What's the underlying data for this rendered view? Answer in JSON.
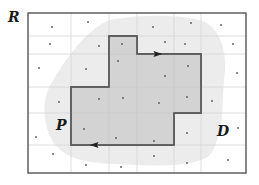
{
  "labels": {
    "region": "R",
    "polygon": "P",
    "domain": "D"
  },
  "colors": {
    "background": "#ffffff",
    "frame": "#555555",
    "grid": "#d6d6d6",
    "blob_fill": "#ececec",
    "polygon_fill": "#cfcfcf",
    "polygon_stroke": "#555555",
    "dot": "#555555",
    "arrow": "#222222"
  },
  "frame": {
    "x": 28,
    "y": 13,
    "width": 218,
    "height": 160
  },
  "grid": {
    "vertical_lines_x": [
      71,
      109,
      137,
      174,
      201
    ],
    "horizontal_lines_y": [
      36,
      54,
      87,
      113,
      145
    ]
  },
  "polygon_P": {
    "vertices": [
      [
        71,
        87
      ],
      [
        109,
        87
      ],
      [
        109,
        36
      ],
      [
        137,
        36
      ],
      [
        137,
        54
      ],
      [
        201,
        54
      ],
      [
        201,
        113
      ],
      [
        174,
        113
      ],
      [
        174,
        145
      ],
      [
        71,
        145
      ]
    ],
    "arrows": [
      {
        "x": 158,
        "y": 54,
        "direction": "right"
      },
      {
        "x": 94,
        "y": 145,
        "direction": "left"
      }
    ]
  },
  "blob_D_path": "M 110 20 C 140 14, 185 14, 205 22 C 222 32, 228 55, 224 80 C 222 105, 224 135, 210 155 C 195 168, 150 166, 115 164 C 85 163, 62 158, 52 140 C 42 120, 42 98, 52 82 C 66 58, 88 28, 110 20 Z",
  "sample_points": [
    [
      52,
      27
    ],
    [
      88,
      22
    ],
    [
      153,
      27
    ],
    [
      191,
      23
    ],
    [
      221,
      25
    ],
    [
      50,
      44
    ],
    [
      99,
      46
    ],
    [
      122,
      44
    ],
    [
      165,
      42
    ],
    [
      185,
      44
    ],
    [
      233,
      44
    ],
    [
      39,
      68
    ],
    [
      86,
      69
    ],
    [
      118,
      61
    ],
    [
      188,
      66
    ],
    [
      165,
      76
    ],
    [
      237,
      73
    ],
    [
      59,
      102
    ],
    [
      99,
      99
    ],
    [
      123,
      98
    ],
    [
      159,
      103
    ],
    [
      187,
      97
    ],
    [
      212,
      101
    ],
    [
      36,
      137
    ],
    [
      84,
      129
    ],
    [
      116,
      138
    ],
    [
      154,
      141
    ],
    [
      187,
      133
    ],
    [
      238,
      128
    ],
    [
      53,
      154
    ],
    [
      86,
      165
    ],
    [
      121,
      167
    ],
    [
      154,
      156
    ],
    [
      187,
      163
    ],
    [
      228,
      160
    ]
  ]
}
